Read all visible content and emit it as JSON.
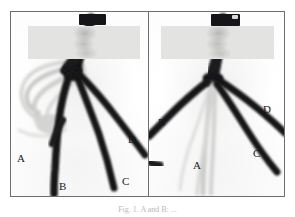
{
  "figure": {
    "caption": "Fig. 1. A and B: ...",
    "frame_color": "#6e6e72",
    "background_color": "#ffffff"
  },
  "panels": [
    {
      "id": "left",
      "name": "left-panel",
      "redaction_band": {
        "name": "redaction-band",
        "color": "#e3e3e1"
      },
      "marker_bar": {
        "name": "marker-bar",
        "color": "#16161a"
      },
      "labels": [
        {
          "text": "A",
          "x": 6,
          "y": 141
        },
        {
          "text": "B",
          "x": 48,
          "y": 169
        },
        {
          "text": "C",
          "x": 111,
          "y": 164
        },
        {
          "text": "D",
          "x": 117,
          "y": 122
        }
      ]
    },
    {
      "id": "right",
      "name": "right-panel",
      "redaction_band": {
        "name": "redaction-band",
        "color": "#e3e3e1"
      },
      "marker_bar": {
        "name": "marker-bar",
        "color": "#16161a"
      },
      "labels": [
        {
          "text": "B",
          "x": 9,
          "y": 105
        },
        {
          "text": "A",
          "x": 44,
          "y": 148
        },
        {
          "text": "C",
          "x": 104,
          "y": 136
        },
        {
          "text": "D",
          "x": 114,
          "y": 92
        }
      ]
    }
  ],
  "colors": {
    "strand_dark": "#141417",
    "strand_pale": "#c9c9c7",
    "plate": "#fdfdfd",
    "label_text": "#1a1a1a",
    "caption_text": "#b9b9bb"
  }
}
